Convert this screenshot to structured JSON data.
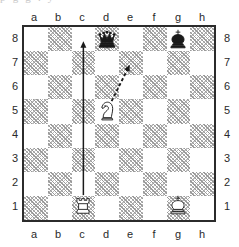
{
  "top_clip_text": "p g  g        .   y",
  "board": {
    "name": "chess-diagram",
    "files": [
      "a",
      "b",
      "c",
      "d",
      "e",
      "f",
      "g",
      "h"
    ],
    "ranks": [
      "8",
      "7",
      "6",
      "5",
      "4",
      "3",
      "2",
      "1"
    ],
    "orientation": "white-bottom",
    "light_square_color": "#ffffff",
    "dark_square_color": "#b0b0b0",
    "border_color": "#2b2b2b",
    "pieces": [
      {
        "square": "d8",
        "color": "black",
        "type": "queen",
        "glyph": "♛",
        "name": "piece-black-queen-d8"
      },
      {
        "square": "g8",
        "color": "black",
        "type": "king",
        "glyph": "♚",
        "name": "piece-black-king-g8"
      },
      {
        "square": "d5",
        "color": "white",
        "type": "knight",
        "glyph": "♘",
        "name": "piece-white-knight-d5"
      },
      {
        "square": "c1",
        "color": "white",
        "type": "rook",
        "glyph": "♖",
        "name": "piece-white-rook-c1"
      },
      {
        "square": "g1",
        "color": "white",
        "type": "king",
        "glyph": "♔",
        "name": "piece-white-king-g1"
      }
    ],
    "arrows": [
      {
        "from": "c1",
        "to": "c8",
        "style": "solid",
        "color": "#1a1a1a",
        "name": "arrow-rook-c1-c8"
      },
      {
        "from": "d5",
        "to": "e7",
        "style": "dashed",
        "color": "#1a1a1a",
        "name": "arrow-knight-d5-e7"
      }
    ]
  }
}
